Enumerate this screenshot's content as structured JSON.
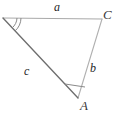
{
  "figure": {
    "type": "triangle-diagram",
    "background_color": "#ffffff",
    "vertices": [
      {
        "id": "top-left",
        "label": "",
        "x": 3,
        "y": 18,
        "has_angle_arc": true
      },
      {
        "id": "top-right",
        "label": "C",
        "x": 102,
        "y": 19,
        "has_angle_arc": false
      },
      {
        "id": "bottom",
        "label": "A",
        "x": 78,
        "y": 98,
        "has_angle_arc": true
      }
    ],
    "vertex_labels": {
      "C": "C",
      "A": "A"
    },
    "sides": [
      {
        "id": "top",
        "label": "a",
        "from": "top-left",
        "to": "top-right",
        "color": "#a9a9a9"
      },
      {
        "id": "right",
        "label": "b",
        "from": "top-right",
        "to": "bottom",
        "color": "#b0b0b0"
      },
      {
        "id": "left",
        "label": "c",
        "from": "top-left",
        "to": "bottom",
        "color": "#6e6e6e"
      }
    ],
    "side_labels": {
      "a": "a",
      "b": "b",
      "c": "c"
    },
    "angle_arcs": [
      {
        "at": "top-left",
        "count": 2,
        "color": "#8a8a8a"
      },
      {
        "at": "bottom",
        "count": 1,
        "color": "#8a8a8a"
      }
    ],
    "stroke_colors": {
      "side_a": "#a9a9a9",
      "side_b": "#b0b0b0",
      "side_c": "#6e6e6e",
      "arc": "#8a8a8a",
      "text": "#2b2b2b"
    }
  }
}
